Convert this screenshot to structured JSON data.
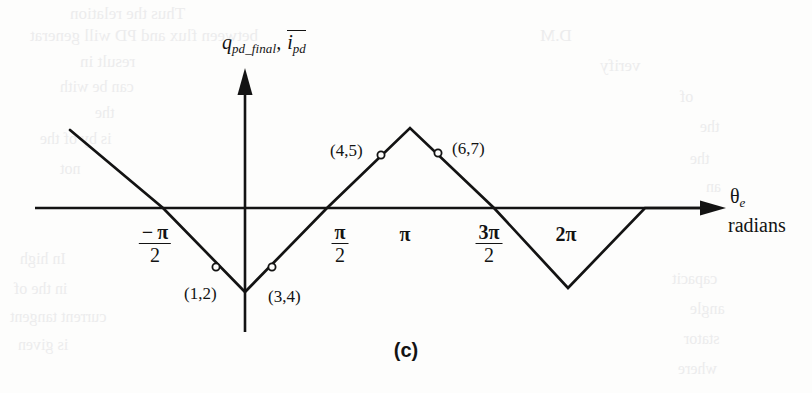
{
  "figure": {
    "caption": "(c)",
    "y_axis": {
      "var1_base": "q",
      "var1_sub": "pd_final",
      "separator": ", ",
      "var2_base": "i",
      "var2_sub": "pd",
      "var2_overline": true
    },
    "x_axis": {
      "symbol": "θ",
      "symbol_sub": "e",
      "units": "radians"
    },
    "tick_labels": [
      {
        "id": "neg-pi-over-2",
        "kind": "fraction",
        "sign": "−",
        "numerator": "π",
        "denominator": "2",
        "x": 155,
        "y": 222
      },
      {
        "id": "pi-over-2",
        "kind": "fraction",
        "sign": "",
        "numerator": "π",
        "denominator": "2",
        "x": 340,
        "y": 222
      },
      {
        "id": "pi",
        "kind": "plain",
        "text": "π",
        "x": 405,
        "y": 224
      },
      {
        "id": "three-pi-over-2",
        "kind": "fraction",
        "sign": "",
        "numerator": "3π",
        "denominator": "2",
        "x": 489,
        "y": 222
      },
      {
        "id": "two-pi",
        "kind": "plain",
        "text": "2π",
        "x": 566,
        "y": 224
      }
    ],
    "point_markers": [
      {
        "label": "(1,2)",
        "mx": 216,
        "my": 267,
        "lx": 184,
        "ly": 285
      },
      {
        "label": "(3,4)",
        "mx": 272,
        "my": 267,
        "lx": 268,
        "ly": 288
      },
      {
        "label": "(4,5)",
        "mx": 381,
        "my": 155,
        "lx": 330,
        "ly": 142
      },
      {
        "label": "(6,7)",
        "mx": 438,
        "my": 153,
        "lx": 452,
        "ly": 140
      }
    ],
    "colors": {
      "ink": "#131313",
      "paper": "#fdfdfc",
      "ghost": "#ececed"
    }
  },
  "chart_data": {
    "type": "line",
    "title": "(c)",
    "xlabel": "θe radians",
    "ylabel": "q_pd_final, ī_pd",
    "grid": false,
    "legend": null,
    "xlim": [
      -2.6,
      8.0
    ],
    "ylim": [
      -1.3,
      1.3
    ],
    "xtick_values": [
      -1.5708,
      1.5708,
      3.1416,
      4.7124,
      6.2832
    ],
    "xtick_labels": [
      "-π/2",
      "π/2",
      "π",
      "3π/2",
      "2π"
    ],
    "series": [
      {
        "name": "q_pd_final",
        "x": [
          -2.35,
          -1.5708,
          0.0,
          1.5708,
          3.1416,
          4.7124,
          6.2832,
          7.55
        ],
        "y": [
          1.0,
          0.0,
          -1.0,
          0.0,
          1.0,
          0.0,
          -1.0,
          0.0
        ],
        "comment": "vertices of the triangular wave: peak at theta=-2.35 start, minima at 0 and 2pi-ish, maximum at pi"
      }
    ],
    "annotated_points": [
      {
        "label": "(1,2)",
        "x": -0.36,
        "y": -0.77
      },
      {
        "label": "(3,4)",
        "x": 0.34,
        "y": -0.78
      },
      {
        "label": "(4,5)",
        "x": 2.62,
        "y": 0.67
      },
      {
        "label": "(6,7)",
        "x": 3.72,
        "y": 0.7
      }
    ]
  },
  "ghost_text": [
    {
      "text": "Thus the  relation",
      "x": 70,
      "y": 4,
      "size": 17
    },
    {
      "text": "between flux  and PD  will generat",
      "x": 30,
      "y": 26,
      "size": 17
    },
    {
      "text": "result in",
      "x": 80,
      "y": 52,
      "size": 17
    },
    {
      "text": "can be with",
      "x": 60,
      "y": 78,
      "size": 16
    },
    {
      "text": "the",
      "x": 95,
      "y": 104,
      "size": 16
    },
    {
      "text": "is by  of the",
      "x": 40,
      "y": 130,
      "size": 16
    },
    {
      "text": "not",
      "x": 60,
      "y": 160,
      "size": 16
    },
    {
      "text": "In  high",
      "x": 20,
      "y": 250,
      "size": 16
    },
    {
      "text": "in  the  of",
      "x": 14,
      "y": 280,
      "size": 16
    },
    {
      "text": "current  tangent",
      "x": 10,
      "y": 308,
      "size": 16
    },
    {
      "text": "is  given",
      "x": 18,
      "y": 336,
      "size": 16
    },
    {
      "text": "D.M",
      "x": 540,
      "y": 26,
      "size": 17
    },
    {
      "text": "verify",
      "x": 600,
      "y": 56,
      "size": 17
    },
    {
      "text": "of",
      "x": 680,
      "y": 88,
      "size": 16
    },
    {
      "text": "the",
      "x": 700,
      "y": 118,
      "size": 16
    },
    {
      "text": "the",
      "x": 690,
      "y": 150,
      "size": 16
    },
    {
      "text": "an",
      "x": 706,
      "y": 178,
      "size": 16
    },
    {
      "text": "capacit",
      "x": 672,
      "y": 270,
      "size": 16
    },
    {
      "text": "angle",
      "x": 690,
      "y": 300,
      "size": 16
    },
    {
      "text": "stator",
      "x": 684,
      "y": 330,
      "size": 16
    },
    {
      "text": "where",
      "x": 678,
      "y": 360,
      "size": 16
    }
  ]
}
